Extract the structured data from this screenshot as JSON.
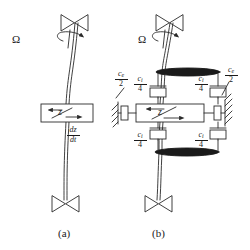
{
  "figure": {
    "type": "rotordynamics-schematic",
    "panels": [
      {
        "id": "a",
        "caption": "(a)",
        "rotation_label": "Ω",
        "disk_label": "z",
        "velocity_label": {
          "numerator": "dz",
          "denominator": "dt"
        },
        "elements": [
          "upper-bearing",
          "flexible-shaft",
          "rotor-disk-block",
          "lower-bearing",
          "rotation-arrow"
        ]
      },
      {
        "id": "b",
        "caption": "(b)",
        "rotation_label": "Ω",
        "disk_label": "z",
        "elements": [
          "upper-bearing",
          "flexible-shaft",
          "rotor-disk-block",
          "lower-bearing",
          "rotation-arrow",
          "upper-disk-plate",
          "lower-disk-plate",
          "internal-dampers",
          "external-dampers",
          "ground-supports"
        ],
        "dampers": [
          {
            "position": "upper-left",
            "symbol": "c",
            "subscript": "i",
            "numerator": "c",
            "denominator": "4",
            "kind": "internal"
          },
          {
            "position": "upper-right",
            "symbol": "c",
            "subscript": "i",
            "numerator": "c",
            "denominator": "4",
            "kind": "internal"
          },
          {
            "position": "lower-left",
            "symbol": "c",
            "subscript": "i",
            "numerator": "c",
            "denominator": "4",
            "kind": "internal"
          },
          {
            "position": "lower-right",
            "symbol": "c",
            "subscript": "i",
            "numerator": "c",
            "denominator": "4",
            "kind": "internal"
          },
          {
            "position": "mid-left",
            "symbol": "c",
            "subscript": "e",
            "numerator": "c",
            "denominator": "2",
            "kind": "external"
          },
          {
            "position": "mid-right",
            "symbol": "c",
            "subscript": "e",
            "numerator": "c",
            "denominator": "2",
            "kind": "external"
          }
        ]
      }
    ],
    "labels": {
      "ci_num": "c",
      "ci_sub": "i",
      "ci_den": "4",
      "ce_num": "c",
      "ce_sub": "e",
      "ce_den": "2",
      "omega": "Ω",
      "z": "z",
      "dz": "dz",
      "dt": "dt",
      "caption_a": "(a)",
      "caption_b": "(b)"
    },
    "colors": {
      "line": "#2a2a2a",
      "background": "#ffffff",
      "disk_fill": "#1a1a1a"
    }
  }
}
